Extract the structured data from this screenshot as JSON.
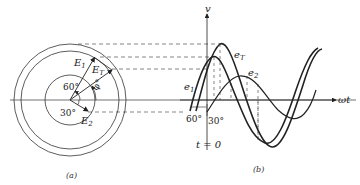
{
  "figure": {
    "panel_a": {
      "caption": "(a)",
      "phasors": [
        {
          "name": "E1",
          "label_main": "E",
          "label_sub": "1",
          "angle_deg": 60
        },
        {
          "name": "ET",
          "label_main": "E",
          "label_sub": "T",
          "angle_deg": 30
        },
        {
          "name": "E2",
          "label_main": "E",
          "label_sub": "2",
          "angle_deg": -30
        }
      ],
      "angle_labels": {
        "a60": "60°",
        "a30": "30°",
        "phi": "φ°"
      }
    },
    "panel_b": {
      "caption": "(b)",
      "y_axis_label": "v",
      "x_axis_label": "ωt",
      "t0_label": "t = 0",
      "angle_labels": {
        "a60": "60°",
        "a30": "30°"
      },
      "curves": [
        {
          "name": "e1",
          "label_main": "e",
          "label_sub": "1"
        },
        {
          "name": "eT",
          "label_main": "e",
          "label_sub": "T"
        },
        {
          "name": "e2",
          "label_main": "e",
          "label_sub": "2"
        }
      ]
    },
    "colors": {
      "ink": "#222222",
      "background": "#ffffff"
    }
  }
}
